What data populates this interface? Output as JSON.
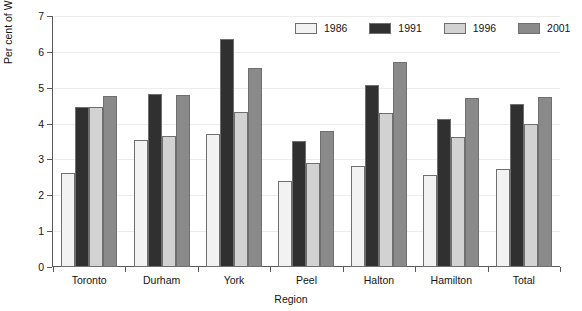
{
  "chart_data": {
    "type": "bar",
    "title": "",
    "xlabel": "Region",
    "ylabel": "Per cent of Work-at-Homes",
    "ylim": [
      0,
      7
    ],
    "yticks": [
      0,
      1,
      2,
      3,
      4,
      5,
      6,
      7
    ],
    "grid": true,
    "legend_position": "top-right",
    "categories": [
      "Toronto",
      "Durham",
      "York",
      "Peel",
      "Halton",
      "Hamilton",
      "Total"
    ],
    "series": [
      {
        "name": "1986",
        "color": "#f2f2f2",
        "values": [
          2.62,
          3.54,
          3.72,
          2.41,
          2.83,
          2.57,
          2.74
        ]
      },
      {
        "name": "1991",
        "color": "#303030",
        "values": [
          4.47,
          4.83,
          6.37,
          3.52,
          5.09,
          4.14,
          4.54
        ]
      },
      {
        "name": "1996",
        "color": "#d2d2d2",
        "values": [
          4.47,
          3.64,
          4.31,
          2.91,
          4.3,
          3.62,
          3.99
        ]
      },
      {
        "name": "2001",
        "color": "#8a8a8a",
        "values": [
          4.78,
          4.8,
          5.54,
          3.8,
          5.72,
          4.7,
          4.73
        ]
      }
    ]
  },
  "clipped_title": ""
}
